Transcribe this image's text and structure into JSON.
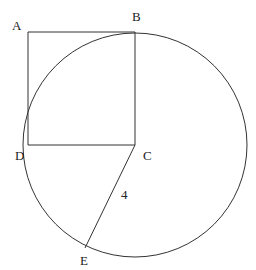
{
  "diagram": {
    "stroke_color": "#333333",
    "background": "#ffffff",
    "points": {
      "A": {
        "label": "A",
        "x": 28,
        "y": 32
      },
      "B": {
        "label": "B",
        "x": 135,
        "y": 32
      },
      "C": {
        "label": "C",
        "x": 135,
        "y": 145
      },
      "D": {
        "label": "D",
        "x": 28,
        "y": 145
      },
      "E": {
        "label": "E",
        "x": 85,
        "y": 248
      }
    },
    "circle": {
      "center": "C",
      "radius": 112
    },
    "segment_labels": {
      "CE": "4"
    }
  }
}
